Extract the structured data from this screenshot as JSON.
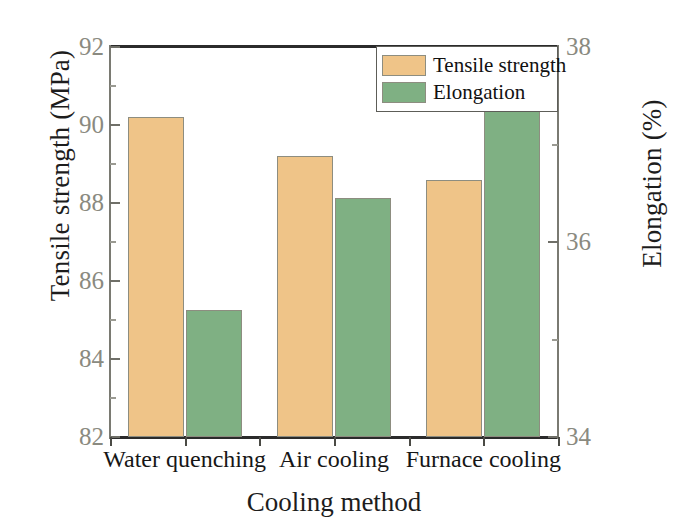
{
  "chart_data": {
    "type": "bar",
    "title": "",
    "xlabel": "Cooling method",
    "ylabel": "Tensile strength (MPa)",
    "y2label": "Elongation (%)",
    "categories": [
      "Water quenching",
      "Air cooling",
      "Furnace cooling"
    ],
    "series": [
      {
        "name": "Tensile strength",
        "axis": "left",
        "color": "#EFC488",
        "unit": "MPa",
        "values": [
          90.2,
          89.2,
          88.6
        ]
      },
      {
        "name": "Elongation",
        "axis": "right",
        "color": "#7FB083",
        "unit": "%",
        "values": [
          35.3,
          36.45,
          38.0
        ]
      }
    ],
    "ylim": [
      82,
      92
    ],
    "y2lim": [
      34,
      38
    ],
    "yticks": [
      82,
      84,
      86,
      88,
      90,
      92
    ],
    "y2ticks": [
      34,
      36,
      38
    ],
    "yminorticks": [
      83,
      85,
      87,
      89,
      91
    ],
    "y2minorticks": [
      35,
      37
    ],
    "grid": false,
    "legend_position": "top-right",
    "legend_entries": [
      "Tensile strength",
      "Elongation"
    ]
  },
  "axes": {
    "left_ticks": [
      "82",
      "84",
      "86",
      "88",
      "90",
      "92"
    ],
    "right_ticks": [
      "34",
      "36",
      "38"
    ],
    "left_title": "Tensile strength (MPa)",
    "right_title": "Elongation (%)",
    "x_title": "Cooling method",
    "x_ticks": [
      "Water quenching",
      "Air cooling",
      "Furnace cooling"
    ]
  },
  "legend": {
    "items": [
      {
        "label": "Tensile strength",
        "color": "#EFC488"
      },
      {
        "label": "Elongation",
        "color": "#7FB083"
      }
    ]
  },
  "colors": {
    "tensile": "#EFC488",
    "elongation": "#7FB083",
    "axis": "#2B2B2B",
    "tick_label": "#8A8A80",
    "title_text": "#1D1D1D"
  }
}
